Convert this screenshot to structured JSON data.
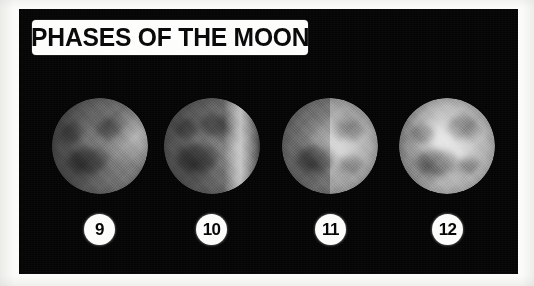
{
  "poster": {
    "title": "PHASES OF THE MOON",
    "background_color": "#ffffff",
    "plate_color": "#050505",
    "label_color": "#fdfdfb",
    "text_color": "#0a0a0a"
  },
  "moons": [
    {
      "badge": "9",
      "phase_name": "waning-gibbous",
      "illumination_side": "right",
      "brightness": "dim",
      "alt": "Moon photograph, dimly lit gibbous disc with a bright limb along the right edge"
    },
    {
      "badge": "10",
      "phase_name": "waning-gibbous-bright-limb",
      "illumination_side": "right",
      "brightness": "medium",
      "alt": "Moon photograph with a bright illuminated band along the right limb"
    },
    {
      "badge": "11",
      "phase_name": "quarter",
      "illumination_side": "right",
      "brightness": "bright",
      "alt": "Moon photograph with a sharp vertical terminator, right half brightly lit"
    },
    {
      "badge": "12",
      "phase_name": "near-full",
      "illumination_side": "full",
      "brightness": "brightest",
      "alt": "Moon photograph, nearly fully illuminated disc showing dark maria"
    }
  ]
}
